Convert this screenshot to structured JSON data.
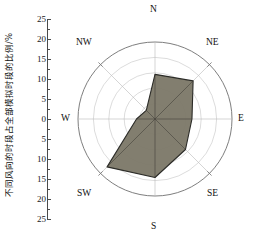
{
  "chart_data": {
    "type": "line",
    "subtype": "wind-rose-polar",
    "title": "",
    "ylabel": "不同风向的时段占全部模拟时段的比例/%",
    "xlabel": "",
    "categories": [
      "N",
      "NE",
      "E",
      "SE",
      "S",
      "SW",
      "W",
      "NW"
    ],
    "values": [
      14.5,
      17.5,
      12.0,
      14.0,
      19.0,
      22.0,
      6.0,
      4.0
    ],
    "unit": "%",
    "rlim": [
      0,
      25
    ],
    "rticks": [
      0,
      5,
      10,
      15,
      20,
      25
    ],
    "axis_tick_labels_top_to_bottom": [
      "25",
      "20",
      "15",
      "10",
      "5",
      "0",
      "5",
      "10",
      "15",
      "20",
      "25"
    ],
    "grid": true,
    "grid_rings": [
      5,
      10,
      15,
      20,
      25
    ],
    "legend": [],
    "series": [
      {
        "name": "风向频率",
        "values": [
          14.5,
          17.5,
          12.0,
          14.0,
          19.0,
          22.0,
          6.0,
          4.0
        ]
      }
    ],
    "fill_color": "#7b7767",
    "line_color": "#2b2b27",
    "grid_color": "#b9b9b9",
    "axis_color": "#4a4a4a"
  },
  "axis": {
    "y_title": "不同风向的时段占全部模拟时段的比例/%",
    "ticks": [
      {
        "label": "25"
      },
      {
        "label": "20"
      },
      {
        "label": "15"
      },
      {
        "label": "10"
      },
      {
        "label": "5"
      },
      {
        "label": "0"
      },
      {
        "label": "5"
      },
      {
        "label": "10"
      },
      {
        "label": "15"
      },
      {
        "label": "20"
      },
      {
        "label": "25"
      }
    ]
  },
  "compass": {
    "n": "N",
    "ne": "NE",
    "e": "E",
    "se": "SE",
    "s": "S",
    "sw": "SW",
    "w": "W",
    "nw": "NW"
  }
}
